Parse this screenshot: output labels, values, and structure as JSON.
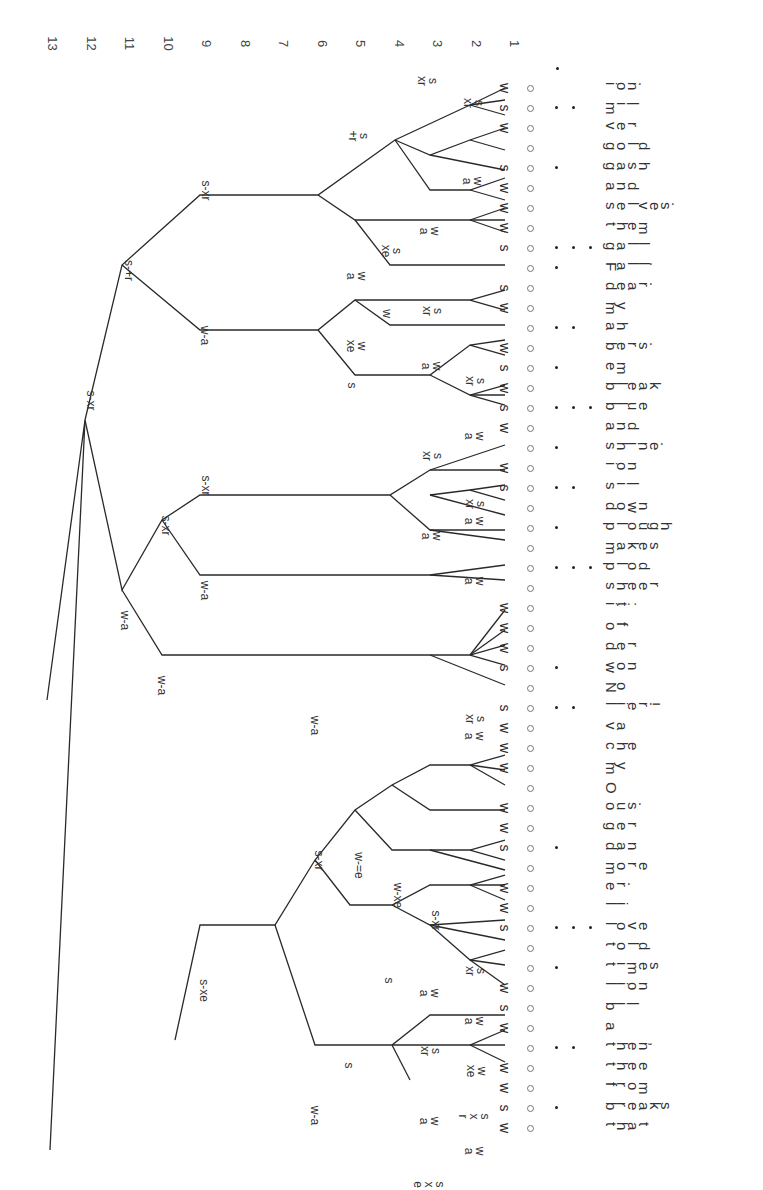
{
  "figure": {
    "scale_levels": [
      "13",
      "12",
      "11",
      "10",
      "9",
      "8",
      "7",
      "6",
      "5",
      "4",
      "3",
      "2",
      "1"
    ],
    "header_dot": "•",
    "rows": [
      {
        "word": "ion.",
        "leaf": "w",
        "dots": 0
      },
      {
        "word": "mil",
        "leaf": "s",
        "dots": 2
      },
      {
        "word": "ver",
        "leaf": "w",
        "dots": 0
      },
      {
        "word": "gold",
        "leaf": "",
        "dots": 0
      },
      {
        "word": "gash",
        "leaf": "s",
        "dots": 1
      },
      {
        "word": "and",
        "leaf": "w",
        "dots": 0
      },
      {
        "word": "selves.",
        "leaf": "w",
        "dots": 0
      },
      {
        "word": "them",
        "leaf": "w",
        "dots": 0
      },
      {
        "word": "gall",
        "leaf": "s",
        "dots": 3
      },
      {
        "word": "Fall.",
        "leaf": "",
        "dots": 1
      },
      {
        "word": "dear.",
        "leaf": "s",
        "dots": 0
      },
      {
        "word": "my",
        "leaf": "w",
        "dots": 0
      },
      {
        "word": "ah",
        "leaf": "",
        "dots": 2
      },
      {
        "word": "bers.",
        "leaf": "w",
        "dots": 0
      },
      {
        "word": "em",
        "leaf": "s",
        "dots": 1
      },
      {
        "word": "bleak",
        "leaf": "w",
        "dots": 0
      },
      {
        "word": "blue",
        "leaf": "s",
        "dots": 3
      },
      {
        "word": "and",
        "leaf": "w",
        "dots": 0
      },
      {
        "word": "shine.",
        "leaf": "",
        "dots": 1
      },
      {
        "word": "ion",
        "leaf": "w",
        "dots": 0
      },
      {
        "word": "sil",
        "leaf": "s",
        "dots": 2
      },
      {
        "word": "down",
        "leaf": "",
        "dots": 0
      },
      {
        "word": "plough",
        "leaf": "",
        "dots": 1
      },
      {
        "word": "makes",
        "leaf": "",
        "dots": 0
      },
      {
        "word": "plod",
        "leaf": "",
        "dots": 3
      },
      {
        "word": "sheer",
        "leaf": "",
        "dots": 0
      },
      {
        "word": "it:",
        "leaf": "w",
        "dots": 0
      },
      {
        "word": "of",
        "leaf": "w",
        "dots": 0
      },
      {
        "word": "der",
        "leaf": "w",
        "dots": 0
      },
      {
        "word": "won",
        "leaf": "s",
        "dots": 1
      },
      {
        "word": "No",
        "leaf": "",
        "dots": 0
      },
      {
        "word": "lier!",
        "leaf": "s",
        "dots": 2
      },
      {
        "word": "va",
        "leaf": "w",
        "dots": 0
      },
      {
        "word": "che",
        "leaf": "w",
        "dots": 0
      },
      {
        "word": "my",
        "leaf": "w",
        "dots": 0
      },
      {
        "word": "O",
        "leaf": "",
        "dots": 0
      },
      {
        "word": "ous.",
        "leaf": "w",
        "dots": 0
      },
      {
        "word": "ger",
        "leaf": "w",
        "dots": 0
      },
      {
        "word": "dan",
        "leaf": "s",
        "dots": 1
      },
      {
        "word": "more",
        "leaf": "",
        "dots": 0
      },
      {
        "word": "er.",
        "leaf": "w",
        "dots": 0
      },
      {
        "word": "li",
        "leaf": "w",
        "dots": 0
      },
      {
        "word": "love",
        "leaf": "s",
        "dots": 3
      },
      {
        "word": "told",
        "leaf": "",
        "dots": 0
      },
      {
        "word": "times",
        "leaf": "",
        "dots": 1
      },
      {
        "word": "lion",
        "leaf": "w",
        "dots": 0
      },
      {
        "word": "bil",
        "leaf": "s",
        "dots": 0
      },
      {
        "word": "a",
        "leaf": "w",
        "dots": 0
      },
      {
        "word": "then,",
        "leaf": "",
        "dots": 2
      },
      {
        "word": "thee",
        "leaf": "w",
        "dots": 0
      },
      {
        "word": "from",
        "leaf": "w",
        "dots": 0
      },
      {
        "word": "breaks",
        "leaf": "s",
        "dots": 1
      },
      {
        "word": "that",
        "leaf": "w",
        "dots": 0
      }
    ],
    "node_labels": [
      {
        "text": "s-xr",
        "x": 80,
        "y": 395
      },
      {
        "text": "s-+r",
        "x": 118,
        "y": 265
      },
      {
        "text": "w-a",
        "x": 115,
        "y": 615
      },
      {
        "text": "s-xr",
        "x": 195,
        "y": 185
      },
      {
        "text": "w-a",
        "x": 195,
        "y": 330
      },
      {
        "text": "s-xr",
        "x": 155,
        "y": 520
      },
      {
        "text": "s-xr",
        "x": 195,
        "y": 480
      },
      {
        "text": "w-a",
        "x": 195,
        "y": 585
      },
      {
        "text": "w-a",
        "x": 152,
        "y": 680
      },
      {
        "text": "s\n+r",
        "x": 352,
        "y": 125
      },
      {
        "text": "w\na",
        "x": 425,
        "y": 220
      },
      {
        "text": "s\nxr",
        "x": 422,
        "y": 70
      },
      {
        "text": "s\nxr",
        "x": 468,
        "y": 92
      },
      {
        "text": "w\na",
        "x": 468,
        "y": 170
      },
      {
        "text": "w\na",
        "x": 352,
        "y": 265
      },
      {
        "text": "s\nxe",
        "x": 385,
        "y": 240
      },
      {
        "text": "w",
        "x": 382,
        "y": 308
      },
      {
        "text": "s",
        "x": 348,
        "y": 380
      },
      {
        "text": "w\nxe",
        "x": 350,
        "y": 335
      },
      {
        "text": "s\nxr",
        "x": 427,
        "y": 300
      },
      {
        "text": "w\na",
        "x": 427,
        "y": 355
      },
      {
        "text": "s\nxr",
        "x": 470,
        "y": 370
      },
      {
        "text": "w\na",
        "x": 470,
        "y": 425
      },
      {
        "text": "s\nxr",
        "x": 427,
        "y": 445
      },
      {
        "text": "w\na",
        "x": 427,
        "y": 525
      },
      {
        "text": "w\na",
        "x": 470,
        "y": 510
      },
      {
        "text": "s\nxr",
        "x": 470,
        "y": 493
      },
      {
        "text": "w\na",
        "x": 470,
        "y": 570
      },
      {
        "text": "s\nxr",
        "x": 470,
        "y": 708
      },
      {
        "text": "w\na",
        "x": 470,
        "y": 725
      },
      {
        "text": "s-xe",
        "x": 192,
        "y": 985
      },
      {
        "text": "w-a",
        "x": 305,
        "y": 720
      },
      {
        "text": "s-xr",
        "x": 308,
        "y": 855
      },
      {
        "text": "w-=e",
        "x": 345,
        "y": 860
      },
      {
        "text": "w-xe",
        "x": 385,
        "y": 890
      },
      {
        "text": "s-xr",
        "x": 425,
        "y": 915
      },
      {
        "text": "w\na",
        "x": 425,
        "y": 982
      },
      {
        "text": "s",
        "x": 385,
        "y": 975
      },
      {
        "text": "s\nxr",
        "x": 470,
        "y": 960
      },
      {
        "text": "w\na",
        "x": 470,
        "y": 1010
      },
      {
        "text": "s",
        "x": 345,
        "y": 1060
      },
      {
        "text": "s\nxr",
        "x": 425,
        "y": 1040
      },
      {
        "text": "w\nxe",
        "x": 470,
        "y": 1060
      },
      {
        "text": "w\na",
        "x": 425,
        "y": 1110
      },
      {
        "text": "s\nx\nr",
        "x": 470,
        "y": 1100
      },
      {
        "text": "w\na",
        "x": 470,
        "y": 1140
      },
      {
        "text": "s\nx\ne",
        "x": 425,
        "y": 1168
      },
      {
        "text": "w-a",
        "x": 305,
        "y": 1110
      },
      {
        "text": "w\nx\ne",
        "x": 425,
        "y": 1210
      }
    ]
  }
}
